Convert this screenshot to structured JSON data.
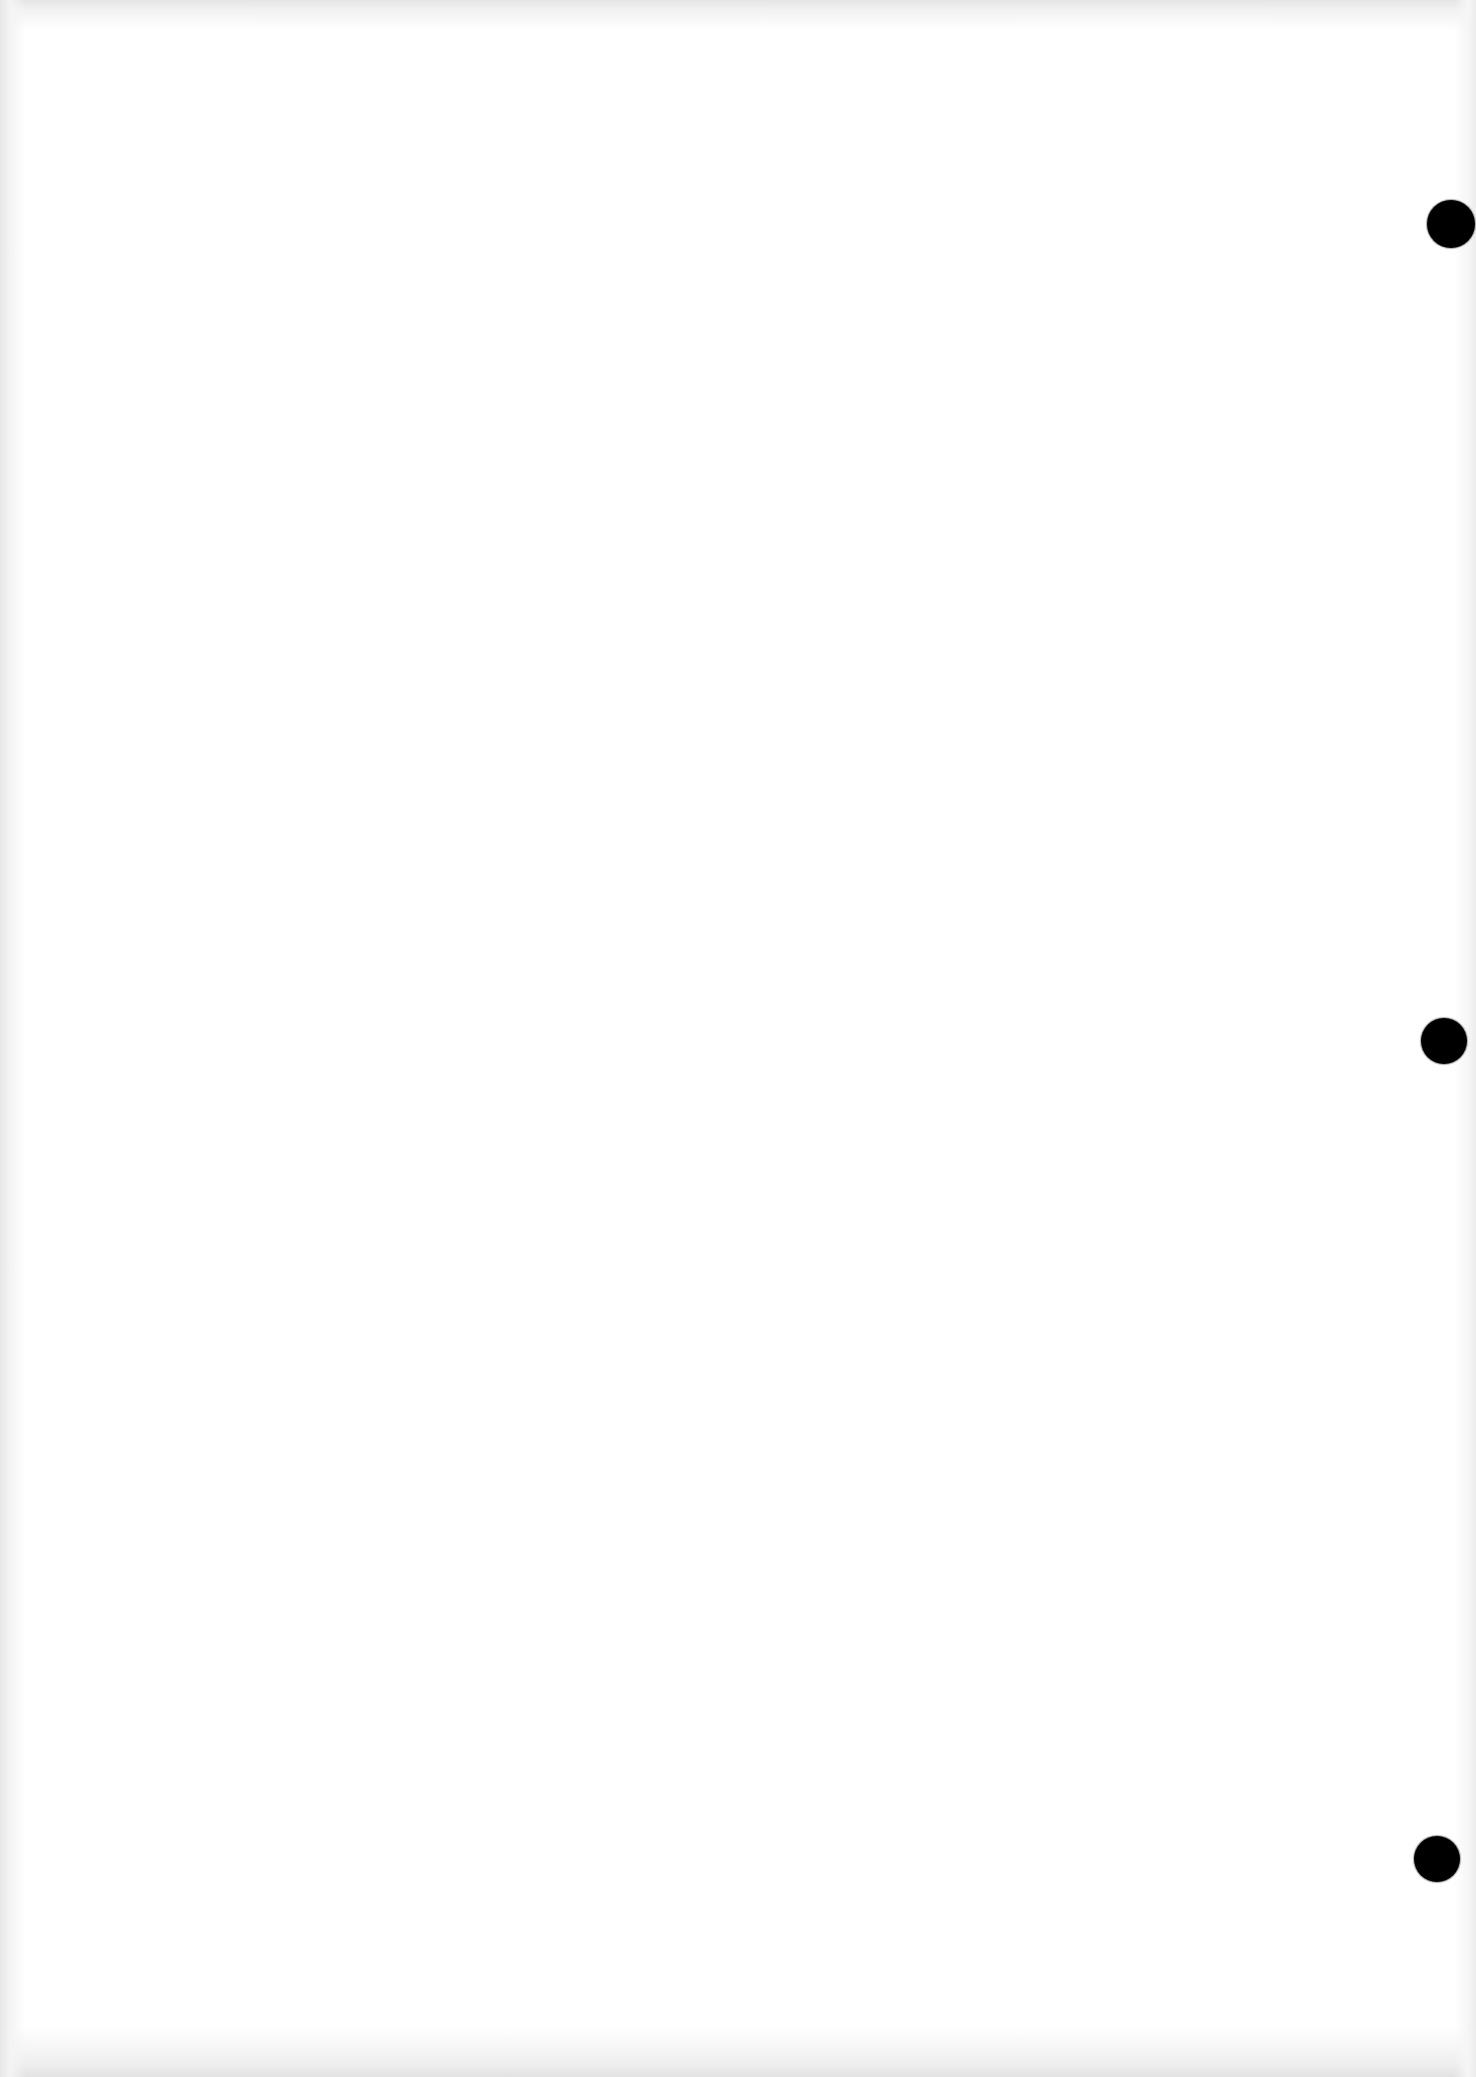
{
  "document": {
    "type": "scanned-page",
    "content": "",
    "background_color": "#ffffff",
    "punch_holes": [
      {
        "position": "top",
        "color": "#000000"
      },
      {
        "position": "middle",
        "color": "#000000"
      },
      {
        "position": "bottom",
        "color": "#000000"
      }
    ]
  }
}
